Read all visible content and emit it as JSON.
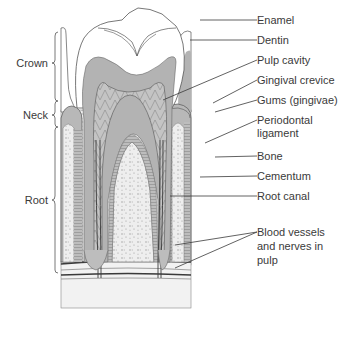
{
  "figure": {
    "type": "labeled anatomical diagram"
  },
  "regions": [
    {
      "label": "Crown",
      "x": 47,
      "y": 63
    },
    {
      "label": "Neck",
      "x": 47,
      "y": 115
    },
    {
      "label": "Root",
      "x": 47,
      "y": 200
    }
  ],
  "labels": [
    {
      "text": "Enamel",
      "y": 14
    },
    {
      "text": "Dentin",
      "y": 34
    },
    {
      "text": "Pulp cavity",
      "y": 54
    },
    {
      "text": "Gingival crevice",
      "y": 74
    },
    {
      "text": "Gums (gingivae)",
      "y": 94
    },
    {
      "text": "Periodontal",
      "y": 114
    },
    {
      "text": "ligament",
      "y": 127
    },
    {
      "text": "Bone",
      "y": 150
    },
    {
      "text": "Cementum",
      "y": 170
    },
    {
      "text": "Root canal",
      "y": 190
    },
    {
      "text": "Blood vessels",
      "y": 226
    },
    {
      "text": "and nerves in",
      "y": 240
    },
    {
      "text": "pulp",
      "y": 254
    }
  ],
  "colors": {
    "dentin": "#b3b3b3",
    "enamel": "#ffffff",
    "pulp": "#c8c8c8",
    "bone": "#ececec",
    "line": "#3a3a3a",
    "label_text": "#3a3a3a"
  }
}
